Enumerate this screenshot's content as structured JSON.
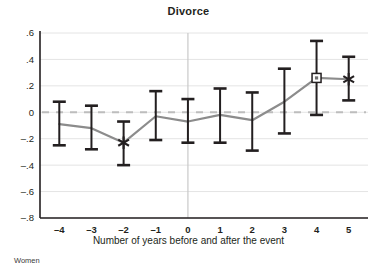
{
  "chart_data": {
    "type": "line",
    "title": "Divorce",
    "subtitle": "",
    "xlabel": "Number of years before and after the event",
    "ylabel": "",
    "footnote": "Women",
    "x": [
      -4,
      -3,
      -2,
      -1,
      0,
      1,
      2,
      3,
      4,
      5
    ],
    "xtick_labels": [
      "–4",
      "–3",
      "–2",
      "–1",
      "0",
      "1",
      "2",
      "3",
      "4",
      "5"
    ],
    "ytick_values": [
      0.6,
      0.4,
      0.2,
      0,
      -0.2,
      -0.4,
      -0.6,
      -0.8
    ],
    "ytick_labels": [
      ".6",
      ".4",
      ".2",
      "0",
      "–.2",
      "–.4",
      "–.6",
      "–.8"
    ],
    "xlim": [
      -4.6,
      5.6
    ],
    "ylim": [
      -0.8,
      0.6
    ],
    "grid": true,
    "legend": "none",
    "series": [
      {
        "name": "Estimate",
        "values": [
          -0.09,
          -0.12,
          -0.23,
          -0.03,
          -0.07,
          -0.02,
          -0.06,
          0.08,
          0.26,
          0.25
        ],
        "ci_low": [
          -0.25,
          -0.28,
          -0.4,
          -0.21,
          -0.23,
          -0.23,
          -0.29,
          -0.16,
          -0.02,
          0.09
        ],
        "ci_high": [
          0.08,
          0.05,
          -0.07,
          0.16,
          0.1,
          0.18,
          0.15,
          0.33,
          0.54,
          0.42
        ],
        "markers": [
          "none",
          "none",
          "star",
          "none",
          "none",
          "none",
          "none",
          "none",
          "square",
          "star"
        ]
      }
    ],
    "reference_lines": [
      {
        "orientation": "horizontal",
        "value": 0,
        "style": "dashed"
      },
      {
        "orientation": "vertical",
        "value": 0,
        "style": "solid"
      }
    ],
    "colors": {
      "line": "#8c8c8c",
      "errorbar": "#231f20",
      "grid": "#e4e4e4",
      "zero_dash": "#bdbdbd",
      "event_line": "#c9c9c9",
      "axis": "#231f20",
      "text": "#231f20"
    }
  }
}
